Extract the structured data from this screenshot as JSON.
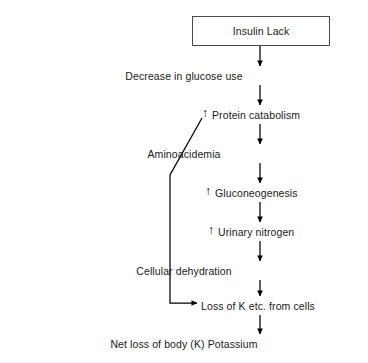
{
  "diagram": {
    "title_box": {
      "label": "Insulin Lack"
    },
    "nodes": [
      {
        "id": "decrease-glucose-use",
        "label": "Decrease in glucose use",
        "increase_marker": "",
        "y": 70
      },
      {
        "id": "protein-catabolism",
        "label": "Protein catabolism",
        "increase_marker": "↑",
        "y": 109
      },
      {
        "id": "aminoacidemia",
        "label": "Aminoacidemia",
        "increase_marker": "",
        "y": 148
      },
      {
        "id": "gluconeogenesis",
        "label": "Gluconeogenesis",
        "increase_marker": "↑",
        "y": 187
      },
      {
        "id": "urinary-nitrogen",
        "label": "Urinary nitrogen",
        "increase_marker": "↑",
        "y": 226
      },
      {
        "id": "cellular-dehydration",
        "label": "Cellular dehydration",
        "increase_marker": "",
        "y": 265
      },
      {
        "id": "loss-of-k-from-cells",
        "label": "Loss of K etc. from cells",
        "increase_marker": "",
        "y": 300
      },
      {
        "id": "net-loss-potassium",
        "label": "Net loss of body (K) Potassium",
        "increase_marker": "",
        "y": 338
      }
    ],
    "colors": {
      "line": "#000000",
      "box_border": "#4a4a4a",
      "text": "#1a1a1a",
      "background": "#ffffff"
    }
  }
}
